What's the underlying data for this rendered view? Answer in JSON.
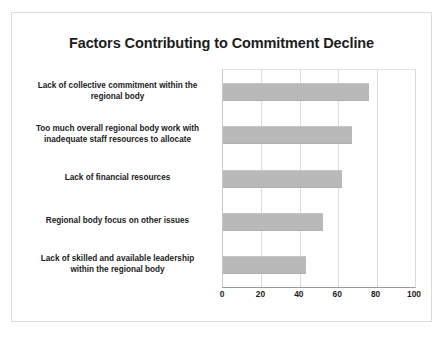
{
  "chart_data": {
    "type": "bar",
    "orientation": "horizontal",
    "title": "Factors Contributing to Commitment Decline",
    "xlabel": "",
    "ylabel": "",
    "xlim": [
      0,
      100
    ],
    "xticks": [
      "0",
      "20",
      "40",
      "60",
      "80",
      "100"
    ],
    "grid": "vertical",
    "legend": "none",
    "categories": [
      "Lack of collective commitment within the\nregional body",
      "Too much overall regional body work with\ninadequate staff resources to allocate",
      "Lack of financial resources",
      "Regional body focus on other issues",
      "Lack of skilled and available leadership\nwithin the regional body"
    ],
    "values": [
      76,
      67,
      62,
      52,
      43
    ],
    "bar_color": "#b9b9b9",
    "background_color": "#ffffff",
    "text_color": "#1b1b1b"
  }
}
